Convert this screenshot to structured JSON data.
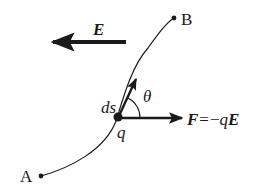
{
  "diagram": {
    "colors": {
      "ink": "#1a1a1a",
      "background": "#ffffff"
    },
    "points": {
      "start": {
        "label": "A"
      },
      "end": {
        "label": "B"
      },
      "charge": {
        "label": "q"
      }
    },
    "field": {
      "label": "E",
      "direction": "left"
    },
    "displacement": {
      "label": "ds"
    },
    "angle": {
      "label": "θ"
    },
    "force": {
      "symbol": "F",
      "equals": "=",
      "expression_sign": "−",
      "expression_q": "q",
      "expression_E": "E",
      "direction": "right"
    }
  }
}
